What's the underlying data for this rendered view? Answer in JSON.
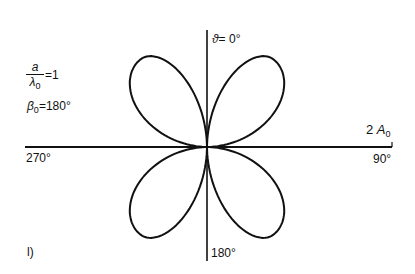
{
  "figure": {
    "panel_label": "l)",
    "params": {
      "ratio_num": "a",
      "ratio_den_sym": "λ",
      "ratio_den_sub": "0",
      "ratio_value": "=1",
      "beta_sym": "β",
      "beta_sub": "0",
      "beta_value": "=180°"
    },
    "axes": {
      "top_label_sym": "ϑ",
      "top_label_value": "= 0°",
      "right_label": "90°",
      "left_label": "270°",
      "bottom_label": "180°",
      "scale_label_prefix": "2",
      "scale_label_sym": "A",
      "scale_label_sub": "0"
    },
    "pattern": {
      "type": "polar",
      "center": [
        207,
        147
      ],
      "lobes": [
        {
          "name": "upper-right",
          "axis_deg": 37,
          "length_px": 110
        },
        {
          "name": "upper-left",
          "axis_deg": -37,
          "length_px": 110
        },
        {
          "name": "lower-right",
          "axis_deg": 143,
          "length_px": 110
        },
        {
          "name": "lower-left",
          "axis_deg": 217,
          "length_px": 110
        }
      ],
      "stroke": "#111111"
    }
  },
  "chart_data": {
    "type": "polar",
    "title": "",
    "annotations": [
      "a/λ0 = 1",
      "β0 = 180°",
      "2 A0",
      "l)"
    ],
    "angle_labels": {
      "0": "ϑ = 0°",
      "90": "90°",
      "180": "180°",
      "270": "270°"
    },
    "theta_deg": [
      0,
      10,
      20,
      30,
      37,
      45,
      60,
      70,
      80,
      90,
      100,
      110,
      120,
      143,
      160,
      170,
      180,
      190,
      200,
      217,
      240,
      250,
      260,
      270,
      280,
      290,
      300,
      323,
      340,
      350
    ],
    "r_relative": [
      0.0,
      0.42,
      0.78,
      0.97,
      1.0,
      0.97,
      0.72,
      0.48,
      0.22,
      0.0,
      0.22,
      0.48,
      0.72,
      1.0,
      0.78,
      0.42,
      0.0,
      0.42,
      0.78,
      1.0,
      0.72,
      0.48,
      0.22,
      0.0,
      0.22,
      0.48,
      0.72,
      1.0,
      0.78,
      0.42
    ],
    "r_max_label": "2 A0",
    "grid": false
  }
}
